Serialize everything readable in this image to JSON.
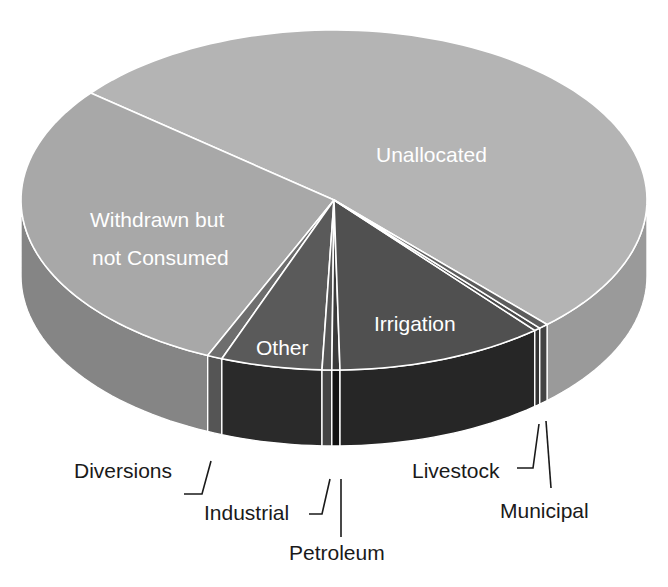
{
  "chart_data": {
    "type": "pie",
    "style": "3d-extruded",
    "title": "",
    "slices": [
      {
        "name": "Unallocated",
        "start_deg": 219.0,
        "end_deg": 407.1,
        "approx_pct": 52.2,
        "top_color": "#b4b4b4",
        "side_color": "#9a9a9a",
        "label_inside": true
      },
      {
        "name": "Withdrawn but not Consumed",
        "start_deg": 113.8,
        "end_deg": 219.0,
        "approx_pct": 29.2,
        "top_color": "#a8a8a8",
        "side_color": "#858585",
        "label_inside": true
      },
      {
        "name": "Diversions",
        "start_deg": 111.0,
        "end_deg": 113.8,
        "approx_pct": 0.8,
        "top_color": "#6e6e6e",
        "side_color": "#555555",
        "label_inside": false
      },
      {
        "name": "Other",
        "start_deg": 92.2,
        "end_deg": 111.0,
        "approx_pct": 5.2,
        "top_color": "#5a5a5a",
        "side_color": "#2a2a2a",
        "label_inside": true
      },
      {
        "name": "Industrial",
        "start_deg": 90.4,
        "end_deg": 92.2,
        "approx_pct": 0.5,
        "top_color": "#555555",
        "side_color": "#444444",
        "label_inside": false
      },
      {
        "name": "Petroleum",
        "start_deg": 88.9,
        "end_deg": 90.4,
        "approx_pct": 0.4,
        "top_color": "#3a3a3a",
        "side_color": "#111111",
        "label_inside": false
      },
      {
        "name": "Irrigation",
        "start_deg": 50.1,
        "end_deg": 88.9,
        "approx_pct": 10.8,
        "top_color": "#505050",
        "side_color": "#262626",
        "label_inside": true
      },
      {
        "name": "Livestock",
        "start_deg": 48.9,
        "end_deg": 50.1,
        "approx_pct": 0.3,
        "top_color": "#4a4a4a",
        "side_color": "#333333",
        "label_inside": false
      },
      {
        "name": "Municipal",
        "start_deg": 47.1,
        "end_deg": 48.9,
        "approx_pct": 0.5,
        "top_color": "#5c5c5c",
        "side_color": "#444444",
        "label_inside": false
      }
    ],
    "geometry": {
      "cx": 334,
      "cy": 200,
      "rx": 313,
      "ry": 170,
      "depth": 76
    },
    "legend": "none (callout labels)"
  },
  "labels": {
    "unallocated": "Unallocated",
    "withdrawn_line1": "Withdrawn but",
    "withdrawn_line2": "not Consumed",
    "other": "Other",
    "irrigation": "Irrigation",
    "diversions": "Diversions",
    "industrial": "Industrial",
    "petroleum": "Petroleum",
    "livestock": "Livestock",
    "municipal": "Municipal"
  }
}
